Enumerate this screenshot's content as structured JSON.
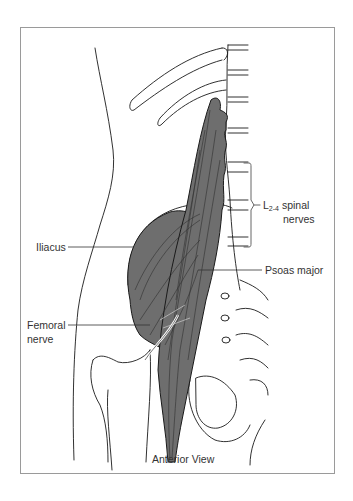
{
  "figure": {
    "caption": "Anterior View",
    "labels": {
      "iliacus": "Iliacus",
      "femoral_line1": "Femoral",
      "femoral_line2": "nerve",
      "psoas": "Psoas major",
      "spinal_L": "L",
      "spinal_sub": "2-4",
      "spinal_rest": " spinal",
      "spinal_line2": "nerves"
    },
    "colors": {
      "muscle_fill": "#6e6e6e",
      "outline": "#1a1a1a",
      "frame_border": "#9a9a9a",
      "label_text": "#333333"
    }
  }
}
